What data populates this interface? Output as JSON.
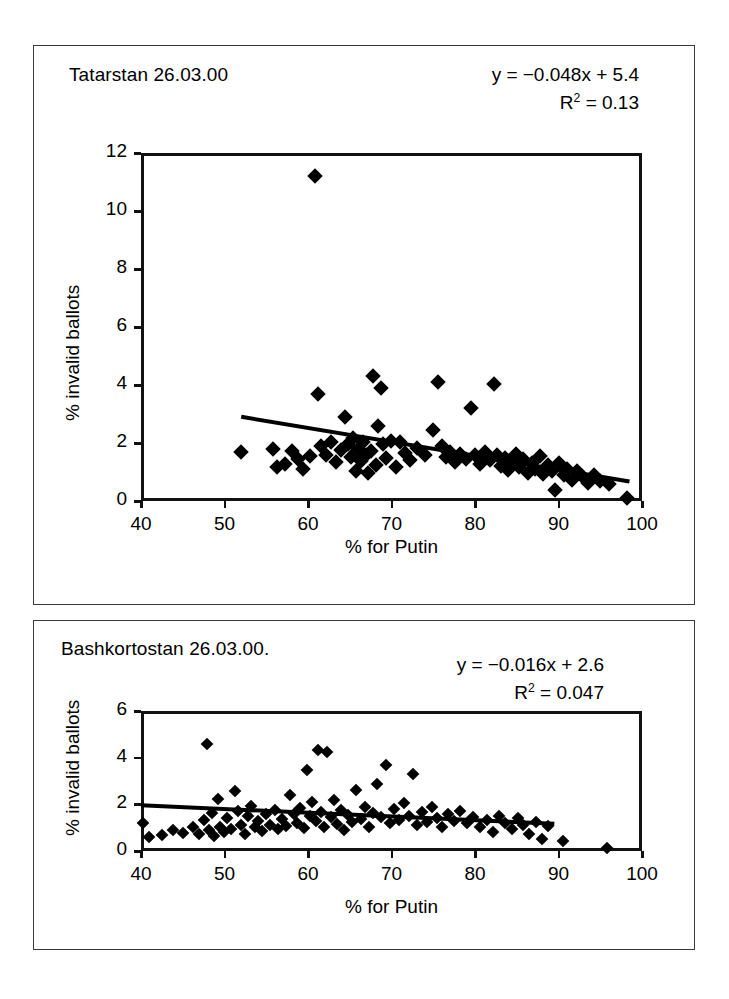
{
  "figure": {
    "axis_label_x": "% for Putin",
    "axis_label_y": "% invalid ballots"
  },
  "panel1": {
    "title": "Tatarstan 26.03.00",
    "equation": "y = −0.048x + 5.4",
    "r2_prefix": "R",
    "r2_exp": "2",
    "r2_value": " = 0.13",
    "xlabel": "% for Putin",
    "ylabel": "% invalid ballots",
    "xticks": [
      "40",
      "50",
      "60",
      "70",
      "80",
      "90",
      "100"
    ],
    "yticks": [
      "12",
      "10",
      "8",
      "6",
      "4",
      "2",
      "0"
    ]
  },
  "panel2": {
    "title": "Bashkortostan  26.03.00.",
    "equation": "y = −0.016x + 2.6",
    "r2_prefix": "R",
    "r2_exp": "2",
    "r2_value": " = 0.047",
    "xlabel": "% for Putin",
    "ylabel": "% invalid ballots",
    "xticks": [
      "40",
      "50",
      "60",
      "70",
      "80",
      "90",
      "100"
    ],
    "yticks": [
      "6",
      "4",
      "2",
      "0"
    ]
  },
  "chart_data": [
    {
      "type": "scatter",
      "title": "Tatarstan 26.03.00",
      "xlabel": "% for Putin",
      "ylabel": "% invalid ballots",
      "xlim": [
        40,
        100
      ],
      "ylim": [
        0,
        12
      ],
      "xticks": [
        40,
        50,
        60,
        70,
        80,
        90,
        100
      ],
      "yticks": [
        0,
        2,
        4,
        6,
        8,
        10,
        12
      ],
      "grid": false,
      "legend": "none",
      "marker": "diamond",
      "marker_color": "#000000",
      "annotations": [
        "y = −0.048x + 5.4",
        "R² = 0.13"
      ],
      "trendline": {
        "slope": -0.048,
        "intercept": 5.4,
        "r2": 0.13,
        "x_start": 52,
        "x_end": 98.5
      },
      "points": [
        [
          52.0,
          1.68
        ],
        [
          55.8,
          1.78
        ],
        [
          56.3,
          1.18
        ],
        [
          57.2,
          1.28
        ],
        [
          58.1,
          1.72
        ],
        [
          58.8,
          1.46
        ],
        [
          59.4,
          1.1
        ],
        [
          60.2,
          1.55
        ],
        [
          60.8,
          11.2
        ],
        [
          61.2,
          3.68
        ],
        [
          61.5,
          1.9
        ],
        [
          62.2,
          1.6
        ],
        [
          62.8,
          2.05
        ],
        [
          63.3,
          1.35
        ],
        [
          63.9,
          1.75
        ],
        [
          64.4,
          2.9
        ],
        [
          64.8,
          1.98
        ],
        [
          65.1,
          1.52
        ],
        [
          65.4,
          2.16
        ],
        [
          65.7,
          1.05
        ],
        [
          66.0,
          1.8
        ],
        [
          66.3,
          1.38
        ],
        [
          66.6,
          2.02
        ],
        [
          66.9,
          1.6
        ],
        [
          67.2,
          0.96
        ],
        [
          67.5,
          1.72
        ],
        [
          67.8,
          4.32
        ],
        [
          68.1,
          1.25
        ],
        [
          68.4,
          2.6
        ],
        [
          68.7,
          3.88
        ],
        [
          69.0,
          1.95
        ],
        [
          69.4,
          1.48
        ],
        [
          69.9,
          2.08
        ],
        [
          70.5,
          1.18
        ],
        [
          71.0,
          2.02
        ],
        [
          71.6,
          1.66
        ],
        [
          72.2,
          1.4
        ],
        [
          73.0,
          1.82
        ],
        [
          74.0,
          1.58
        ],
        [
          75.0,
          2.46
        ],
        [
          75.6,
          4.12
        ],
        [
          76.0,
          1.88
        ],
        [
          76.5,
          1.52
        ],
        [
          77.0,
          1.7
        ],
        [
          77.6,
          1.34
        ],
        [
          78.2,
          1.62
        ],
        [
          78.9,
          1.46
        ],
        [
          79.5,
          3.22
        ],
        [
          80.0,
          1.58
        ],
        [
          80.6,
          1.28
        ],
        [
          81.2,
          1.7
        ],
        [
          81.8,
          1.42
        ],
        [
          82.3,
          4.05
        ],
        [
          82.6,
          1.6
        ],
        [
          83.1,
          1.22
        ],
        [
          83.6,
          1.5
        ],
        [
          84.0,
          1.08
        ],
        [
          84.4,
          1.36
        ],
        [
          84.9,
          1.62
        ],
        [
          85.3,
          1.18
        ],
        [
          85.8,
          1.44
        ],
        [
          86.3,
          0.98
        ],
        [
          86.8,
          1.3
        ],
        [
          87.2,
          1.12
        ],
        [
          87.8,
          1.55
        ],
        [
          88.2,
          0.92
        ],
        [
          88.7,
          1.24
        ],
        [
          89.2,
          1.02
        ],
        [
          89.6,
          0.38
        ],
        [
          90.1,
          1.3
        ],
        [
          90.6,
          0.88
        ],
        [
          91.0,
          1.1
        ],
        [
          91.6,
          0.72
        ],
        [
          92.2,
          1.02
        ],
        [
          92.8,
          0.86
        ],
        [
          93.5,
          0.62
        ],
        [
          94.2,
          0.9
        ],
        [
          95.0,
          0.7
        ],
        [
          96.0,
          0.58
        ],
        [
          98.2,
          0.1
        ]
      ]
    },
    {
      "type": "scatter",
      "title": "Bashkortostan  26.03.00.",
      "xlabel": "% for Putin",
      "ylabel": "% invalid ballots",
      "xlim": [
        40,
        100
      ],
      "ylim": [
        0,
        6
      ],
      "xticks": [
        40,
        50,
        60,
        70,
        80,
        90,
        100
      ],
      "yticks": [
        0,
        2,
        4,
        6
      ],
      "grid": false,
      "legend": "none",
      "marker": "diamond",
      "marker_color": "#000000",
      "annotations": [
        "y = −0.016x + 2.6",
        "R² = 0.047"
      ],
      "trendline": {
        "slope": -0.016,
        "intercept": 2.6,
        "r2": 0.047,
        "x_start": 40,
        "x_end": 89.5
      },
      "points": [
        [
          40.2,
          1.18
        ],
        [
          41.0,
          0.62
        ],
        [
          42.5,
          0.7
        ],
        [
          43.8,
          0.92
        ],
        [
          45.0,
          0.78
        ],
        [
          46.2,
          1.02
        ],
        [
          47.0,
          0.74
        ],
        [
          47.6,
          1.34
        ],
        [
          47.9,
          4.6
        ],
        [
          48.2,
          0.88
        ],
        [
          48.5,
          1.62
        ],
        [
          48.8,
          0.66
        ],
        [
          49.2,
          2.22
        ],
        [
          49.5,
          1.05
        ],
        [
          49.9,
          0.8
        ],
        [
          50.3,
          1.4
        ],
        [
          50.8,
          0.96
        ],
        [
          51.2,
          2.58
        ],
        [
          51.6,
          1.7
        ],
        [
          52.0,
          1.12
        ],
        [
          52.4,
          0.74
        ],
        [
          52.8,
          1.48
        ],
        [
          53.2,
          1.92
        ],
        [
          53.6,
          1.02
        ],
        [
          54.0,
          1.3
        ],
        [
          54.5,
          0.86
        ],
        [
          55.0,
          1.58
        ],
        [
          55.5,
          1.12
        ],
        [
          56.0,
          1.76
        ],
        [
          56.4,
          0.94
        ],
        [
          56.9,
          1.36
        ],
        [
          57.4,
          1.08
        ],
        [
          57.9,
          2.42
        ],
        [
          58.3,
          1.6
        ],
        [
          58.7,
          1.22
        ],
        [
          59.1,
          1.84
        ],
        [
          59.5,
          0.98
        ],
        [
          59.9,
          3.48
        ],
        [
          60.2,
          1.52
        ],
        [
          60.5,
          2.08
        ],
        [
          60.9,
          1.3
        ],
        [
          61.2,
          4.32
        ],
        [
          61.5,
          1.68
        ],
        [
          61.9,
          1.02
        ],
        [
          62.3,
          4.25
        ],
        [
          62.7,
          1.44
        ],
        [
          63.1,
          2.2
        ],
        [
          63.5,
          1.16
        ],
        [
          63.9,
          1.74
        ],
        [
          64.3,
          0.88
        ],
        [
          64.8,
          1.56
        ],
        [
          65.3,
          1.26
        ],
        [
          65.8,
          2.62
        ],
        [
          66.3,
          1.38
        ],
        [
          66.8,
          1.9
        ],
        [
          67.3,
          1.04
        ],
        [
          67.8,
          1.62
        ],
        [
          68.3,
          2.88
        ],
        [
          68.8,
          1.44
        ],
        [
          69.3,
          3.7
        ],
        [
          69.8,
          1.18
        ],
        [
          70.3,
          1.8
        ],
        [
          70.9,
          1.32
        ],
        [
          71.5,
          2.06
        ],
        [
          72.1,
          1.48
        ],
        [
          72.6,
          3.3
        ],
        [
          73.0,
          1.12
        ],
        [
          73.6,
          1.66
        ],
        [
          74.2,
          1.26
        ],
        [
          74.8,
          1.88
        ],
        [
          75.4,
          1.42
        ],
        [
          76.0,
          1.04
        ],
        [
          76.8,
          1.58
        ],
        [
          77.5,
          1.3
        ],
        [
          78.2,
          1.72
        ],
        [
          79.0,
          1.2
        ],
        [
          79.8,
          1.46
        ],
        [
          80.6,
          1.04
        ],
        [
          81.4,
          1.34
        ],
        [
          82.2,
          0.82
        ],
        [
          82.9,
          1.52
        ],
        [
          83.6,
          1.18
        ],
        [
          84.4,
          0.96
        ],
        [
          85.1,
          1.4
        ],
        [
          85.8,
          1.1
        ],
        [
          86.5,
          0.74
        ],
        [
          87.3,
          1.26
        ],
        [
          88.0,
          0.52
        ],
        [
          88.8,
          1.08
        ],
        [
          90.5,
          0.42
        ],
        [
          95.8,
          0.12
        ]
      ]
    }
  ]
}
